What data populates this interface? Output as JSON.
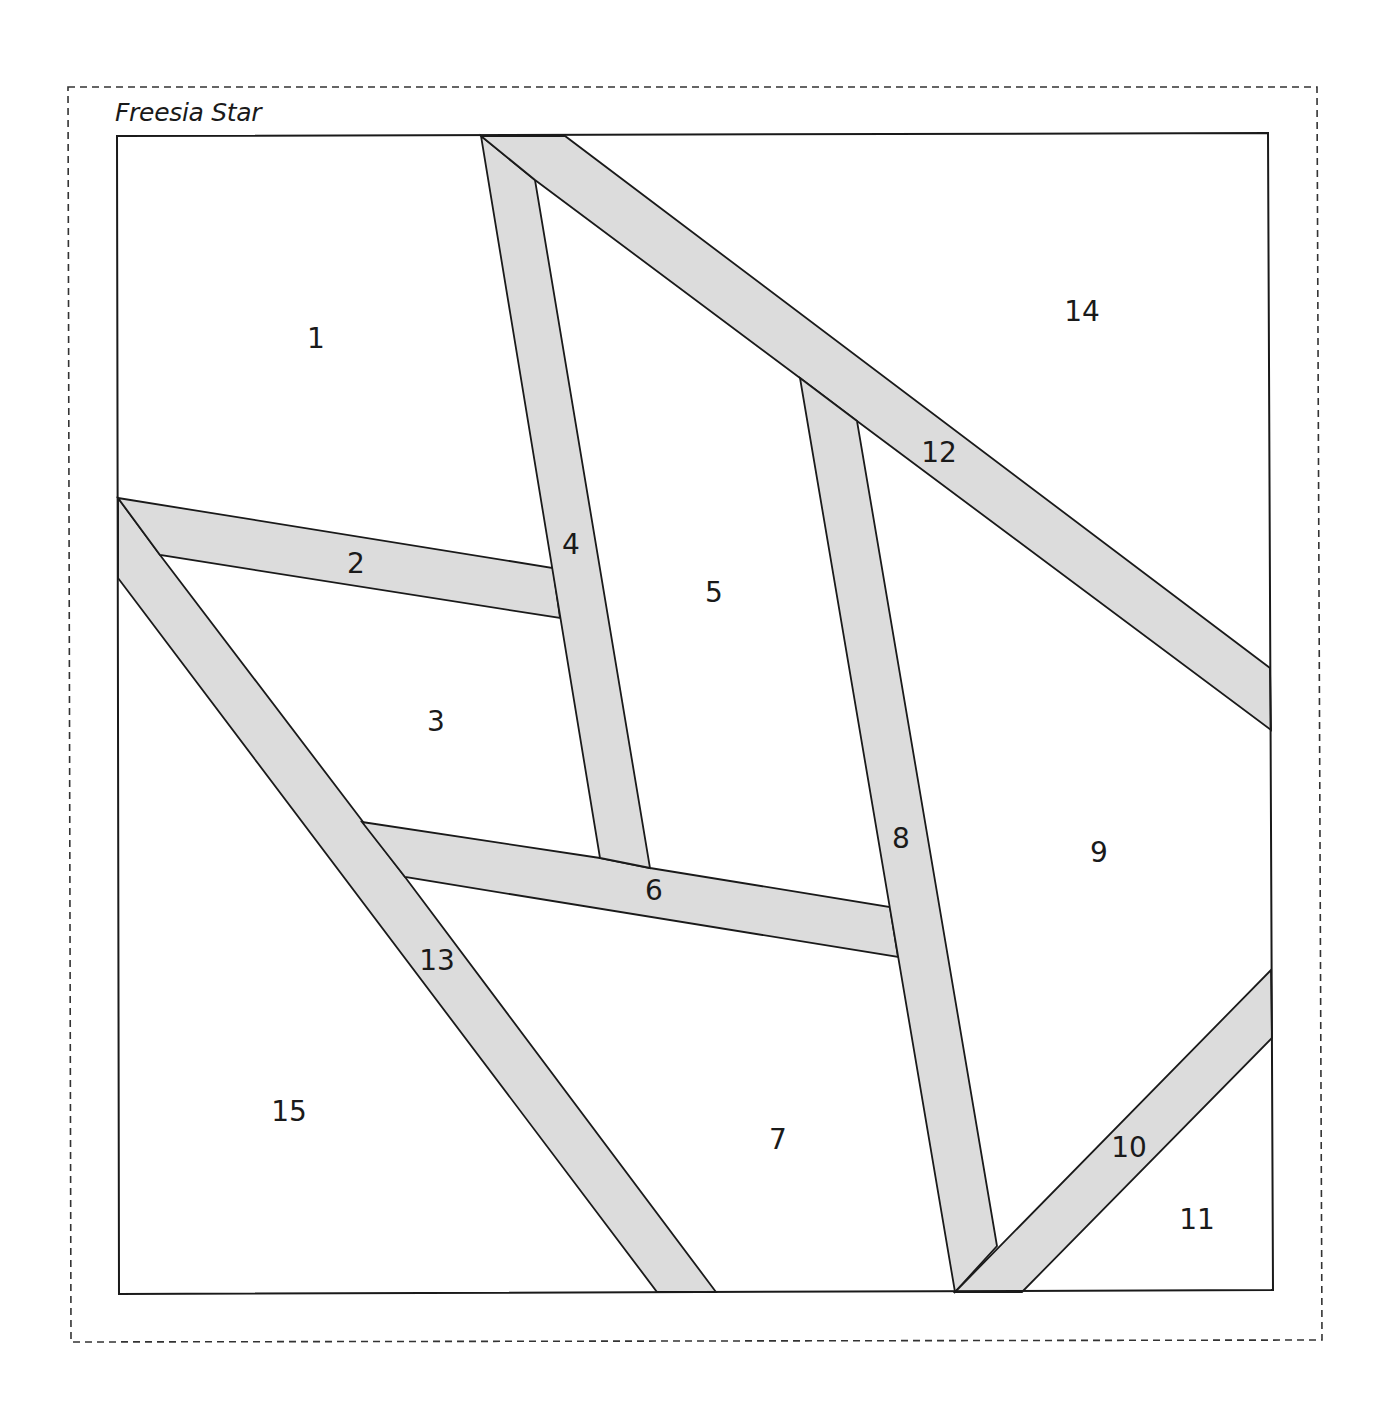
{
  "title": "Freesia Star",
  "colors": {
    "strip_fill": "#dcdcdc",
    "outline": "#1a1a1a",
    "background": "#ffffff"
  },
  "pieces": [
    {
      "id": "1",
      "label": "1",
      "x": 316,
      "y": 340
    },
    {
      "id": "2",
      "label": "2",
      "x": 356,
      "y": 565
    },
    {
      "id": "3",
      "label": "3",
      "x": 436,
      "y": 723
    },
    {
      "id": "4",
      "label": "4",
      "x": 571,
      "y": 546
    },
    {
      "id": "5",
      "label": "5",
      "x": 714,
      "y": 594
    },
    {
      "id": "6",
      "label": "6",
      "x": 654,
      "y": 892
    },
    {
      "id": "7",
      "label": "7",
      "x": 778,
      "y": 1141
    },
    {
      "id": "8",
      "label": "8",
      "x": 901,
      "y": 840
    },
    {
      "id": "9",
      "label": "9",
      "x": 1099,
      "y": 854
    },
    {
      "id": "10",
      "label": "10",
      "x": 1129,
      "y": 1149
    },
    {
      "id": "11",
      "label": "11",
      "x": 1197,
      "y": 1221
    },
    {
      "id": "12",
      "label": "12",
      "x": 939,
      "y": 454
    },
    {
      "id": "13",
      "label": "13",
      "x": 437,
      "y": 962
    },
    {
      "id": "14",
      "label": "14",
      "x": 1082,
      "y": 313
    },
    {
      "id": "15",
      "label": "15",
      "x": 289,
      "y": 1113
    }
  ]
}
